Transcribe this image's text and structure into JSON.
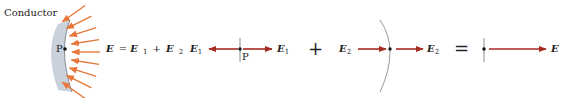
{
  "colors": {
    "field_line": "#e8773a",
    "vector": "#a52a21",
    "conductor_fill": "#c9d2dc",
    "conductor_edge": "#6b7680",
    "surface_line": "#8a8f94",
    "dot": "#111111"
  },
  "labels": {
    "conductor": "Conductor",
    "point": "P",
    "point_mid": "P",
    "equation": {
      "lhs": "E",
      "eq": " = ",
      "t1": "E",
      "t1_sub": "1",
      "plus": "+",
      "t2": "E",
      "t2_sub": "2"
    },
    "e1_left": "E",
    "e1_left_sub": "1",
    "e1_right": "E",
    "e1_right_sub": "1",
    "plus_sign": "+",
    "e2_left": "E",
    "e2_left_sub": "2",
    "e2_right": "E",
    "e2_right_sub": "2",
    "equals_sign": "=",
    "e_total": "E"
  },
  "field_line_count": 9
}
